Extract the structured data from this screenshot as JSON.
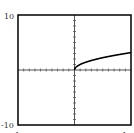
{
  "chart_data": {
    "type": "line",
    "title": "",
    "xlabel": "",
    "ylabel": "",
    "xlim": [
      -10,
      10
    ],
    "ylim": [
      -10,
      10
    ],
    "x_tick_labels": [
      "-10",
      "10"
    ],
    "y_tick_labels": [
      "10",
      "-10"
    ],
    "tick_spacing": 1,
    "grid": false,
    "series": [
      {
        "name": "y = sqrt(x)",
        "x": [
          0,
          0.25,
          0.5,
          1,
          2,
          3,
          4,
          5,
          6,
          7,
          8,
          9,
          10
        ],
        "values": [
          0,
          0.5,
          0.71,
          1,
          1.41,
          1.73,
          2,
          2.24,
          2.45,
          2.65,
          2.83,
          3,
          3.16
        ]
      }
    ]
  },
  "labels": {
    "y_max": "10",
    "y_min": "-10",
    "x_min": "-10",
    "x_max": "10"
  },
  "colors": {
    "frame": "#000000",
    "curve": "#000000",
    "axis": "#555555"
  }
}
